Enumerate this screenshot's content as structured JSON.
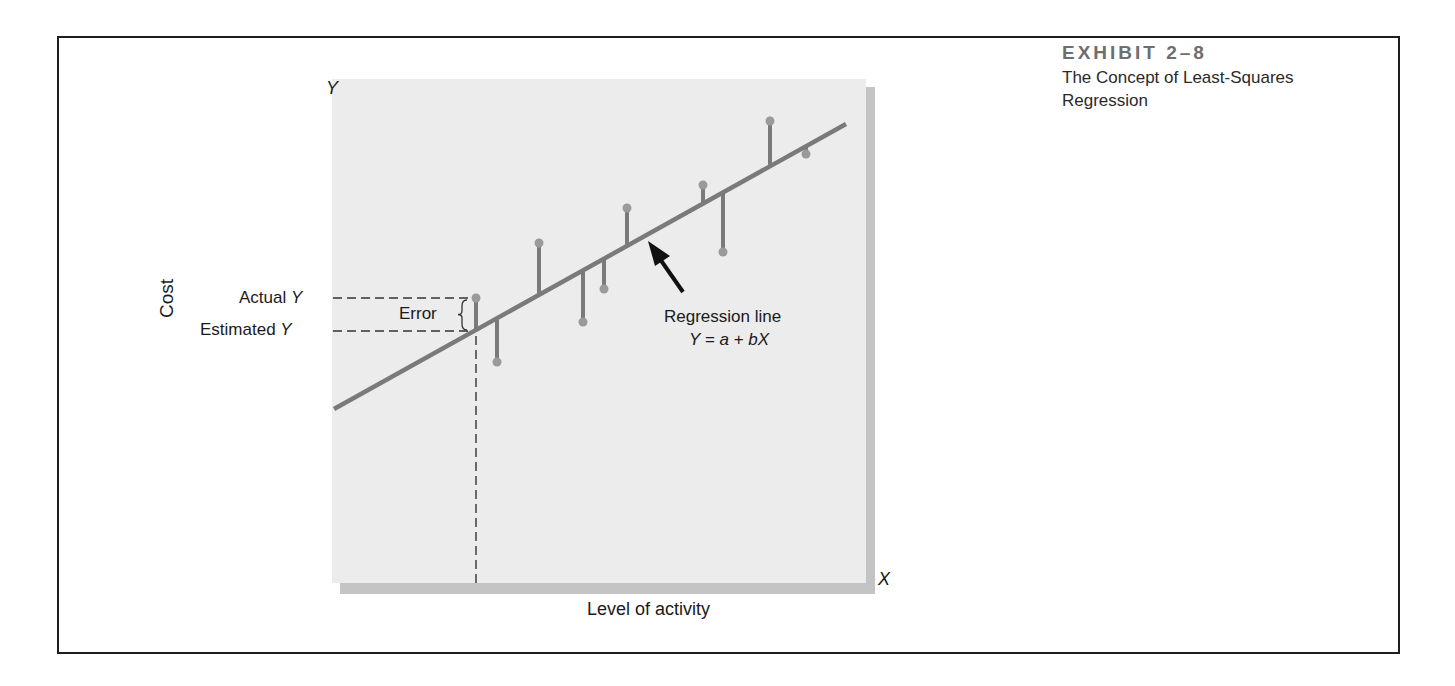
{
  "exhibit": {
    "number": "EXHIBIT 2–8",
    "title": "The Concept of Least-Squares Regression"
  },
  "axes": {
    "y_axis_letter": "Y",
    "x_axis_letter": "X",
    "y_label": "Cost",
    "x_label": "Level of activity"
  },
  "annotations": {
    "actual_y": "Actual ",
    "actual_y_var": "Y",
    "estimated_y": "Estimated ",
    "estimated_y_var": "Y",
    "error": "Error",
    "regression_line": "Regression line",
    "equation": "Y = a + bX"
  },
  "colors": {
    "plot_background": "#ececec",
    "line_color": "#7a7a7a",
    "point_color": "#9a9a9a",
    "frame_color": "#1e1e1e"
  },
  "chart_data": {
    "type": "scatter",
    "title": "The Concept of Least-Squares Regression",
    "xlabel": "Level of activity",
    "ylabel": "Cost",
    "regression_line": {
      "equation": "Y = a + bX",
      "start": [
        334,
        409
      ],
      "end": [
        846,
        124
      ]
    },
    "points_pixel": [
      {
        "x": 476,
        "y_actual": 298,
        "y_estimated": 331,
        "highlighted": true
      },
      {
        "x": 497,
        "y_actual": 362,
        "y_estimated": 320
      },
      {
        "x": 539,
        "y_actual": 243,
        "y_estimated": 296
      },
      {
        "x": 583,
        "y_actual": 322,
        "y_estimated": 272
      },
      {
        "x": 604,
        "y_actual": 289,
        "y_estimated": 260
      },
      {
        "x": 627,
        "y_actual": 208,
        "y_estimated": 247
      },
      {
        "x": 703,
        "y_actual": 185,
        "y_estimated": 205
      },
      {
        "x": 723,
        "y_actual": 252,
        "y_estimated": 194
      },
      {
        "x": 770,
        "y_actual": 121,
        "y_estimated": 167
      },
      {
        "x": 806,
        "y_actual": 154,
        "y_estimated": 147
      }
    ],
    "grid": false,
    "legend": null
  }
}
